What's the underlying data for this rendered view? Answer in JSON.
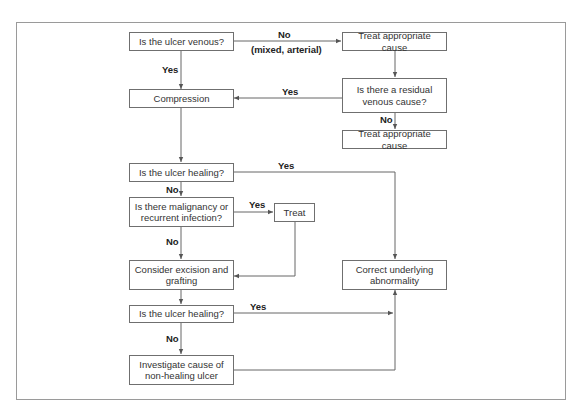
{
  "diagram": {
    "type": "flowchart",
    "nodes": {
      "q_venous": "Is the ulcer venous?",
      "treat_cause_1": "Treat appropriate cause",
      "compression": "Compression",
      "q_residual": "Is there a residual venous cause?",
      "treat_cause_2": "Treat appropriate cause",
      "q_healing_1": "Is the ulcer healing?",
      "q_malignancy": "Is there malignancy or recurrent infection?",
      "treat": "Treat",
      "consider_excision": "Consider excision and grafting",
      "correct_abnormality": "Correct underlying abnormality",
      "q_healing_2": "Is the ulcer healing?",
      "investigate": "Investigate cause of non-healing ulcer"
    },
    "edge_labels": {
      "venous_no": "No",
      "venous_no_detail": "(mixed, arterial)",
      "venous_yes": "Yes",
      "residual_yes": "Yes",
      "residual_no": "No",
      "healing1_yes": "Yes",
      "healing1_no": "No",
      "malignancy_yes": "Yes",
      "malignancy_no": "No",
      "healing2_yes": "Yes",
      "healing2_no": "No"
    },
    "edges": [
      {
        "from": "q_venous",
        "to": "treat_cause_1",
        "label": "No (mixed, arterial)"
      },
      {
        "from": "q_venous",
        "to": "compression",
        "label": "Yes"
      },
      {
        "from": "treat_cause_1",
        "to": "q_residual",
        "label": ""
      },
      {
        "from": "q_residual",
        "to": "compression",
        "label": "Yes"
      },
      {
        "from": "q_residual",
        "to": "treat_cause_2",
        "label": "No"
      },
      {
        "from": "compression",
        "to": "q_healing_1",
        "label": ""
      },
      {
        "from": "q_healing_1",
        "to": "correct_abnormality",
        "label": "Yes"
      },
      {
        "from": "q_healing_1",
        "to": "q_malignancy",
        "label": "No"
      },
      {
        "from": "q_malignancy",
        "to": "treat",
        "label": "Yes"
      },
      {
        "from": "q_malignancy",
        "to": "consider_excision",
        "label": "No"
      },
      {
        "from": "treat",
        "to": "consider_excision",
        "label": ""
      },
      {
        "from": "consider_excision",
        "to": "q_healing_2",
        "label": ""
      },
      {
        "from": "q_healing_2",
        "to": "correct_abnormality",
        "label": "Yes"
      },
      {
        "from": "q_healing_2",
        "to": "investigate",
        "label": "No"
      },
      {
        "from": "investigate",
        "to": "correct_abnormality",
        "label": ""
      }
    ]
  }
}
